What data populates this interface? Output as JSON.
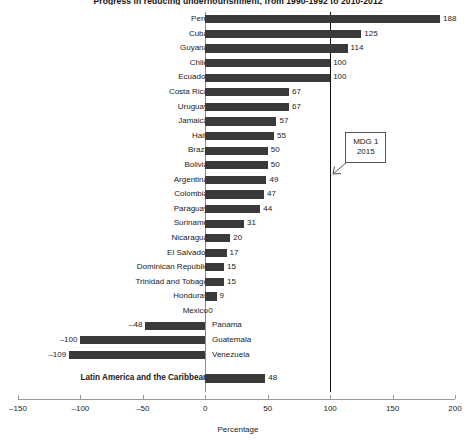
{
  "chart_data": {
    "type": "bar",
    "orientation": "horizontal",
    "title": "Progress in reducing undernourishment, from 1990-1992 to 2010-2012",
    "xlabel": "Percentage",
    "ylabel": "",
    "xlim": [
      -150,
      200
    ],
    "xticks": [
      -150,
      -100,
      -50,
      0,
      50,
      100,
      150,
      200
    ],
    "xtick_labels": [
      "–150",
      "–100",
      "–50",
      "0",
      "50",
      "100",
      "150",
      "200"
    ],
    "grid": false,
    "legend": null,
    "bar_color": "#3a3a3a",
    "reference_line": {
      "value": 100,
      "label_line1": "MDG 1",
      "label_line2": "2015"
    },
    "categories": [
      "Peru",
      "Cuba",
      "Guyana",
      "Chile",
      "Ecuador",
      "Costa Rica",
      "Uruguay",
      "Jamaica",
      "Haiti",
      "Brazil",
      "Bolivia",
      "Argentina",
      "Colombia",
      "Paraguay",
      "Suriname",
      "Nicaragua",
      "El Salvador",
      "Dominican Republic",
      "Trinidad and Tobago",
      "Honduras",
      "Mexico",
      "Panama",
      "Guatemala",
      "Venezuela"
    ],
    "values": [
      188,
      125,
      114,
      100,
      100,
      67,
      67,
      57,
      55,
      50,
      50,
      49,
      47,
      44,
      31,
      20,
      17,
      15,
      15,
      9,
      0,
      -48,
      -100,
      -109
    ],
    "value_labels": [
      "188",
      "125",
      "114",
      "100",
      "100",
      "67",
      "67",
      "57",
      "55",
      "50",
      "50",
      "49",
      "47",
      "44",
      "31",
      "20",
      "17",
      "15",
      "15",
      "9",
      "0",
      "–48",
      "–100",
      "–109"
    ],
    "summary": {
      "category": "Latin America and the Caribbean",
      "value": 48,
      "value_label": "48"
    }
  },
  "axis": {
    "title": "Percentage"
  }
}
